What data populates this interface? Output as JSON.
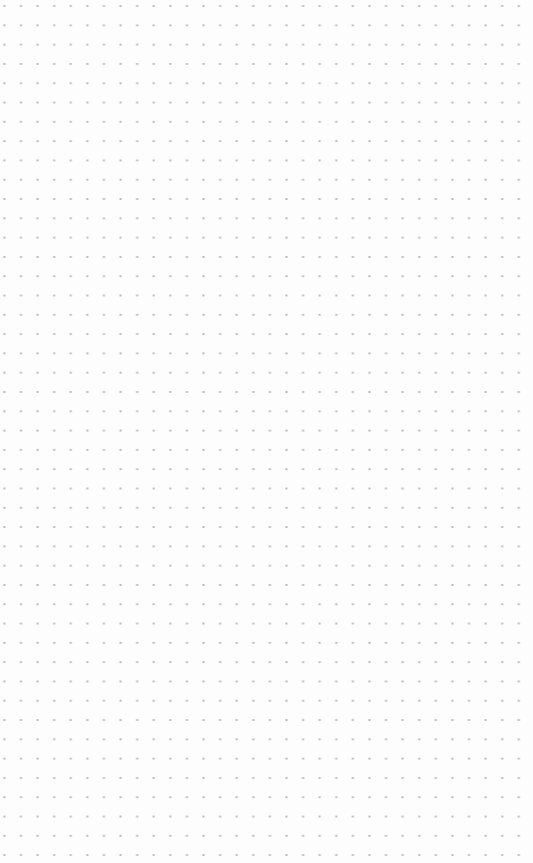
{
  "canvas": {
    "background": "#fdfdfd",
    "grid": {
      "type": "dot-grid",
      "dot_color": "#b8b8b8",
      "spacing_x": 16.6,
      "spacing_y": 19.3
    }
  }
}
